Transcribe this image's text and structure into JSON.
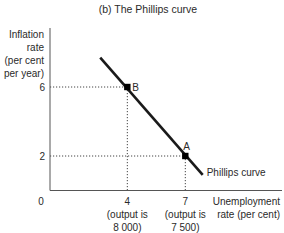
{
  "chart_data": {
    "type": "line",
    "title": "(b) The Phillips curve",
    "ylabel_lines": [
      "Inflation",
      "rate",
      "(per cent",
      "per year)"
    ],
    "xlabel_lines": [
      "Unemployment",
      "rate (per cent)"
    ],
    "origin_label": "0",
    "xlim": [
      0,
      9
    ],
    "ylim": [
      0,
      8
    ],
    "grid": false,
    "x_ticks": [
      {
        "value": 4,
        "label": "4",
        "sublabel_lines": [
          "(output is",
          "8 000)"
        ]
      },
      {
        "value": 7,
        "label": "7",
        "sublabel_lines": [
          "(output is",
          "7 500)"
        ]
      }
    ],
    "y_ticks": [
      {
        "value": 6,
        "label": "6"
      },
      {
        "value": 2,
        "label": "2"
      }
    ],
    "series": [
      {
        "name": "Phillips curve",
        "label": "Phillips curve",
        "color": "#1a1a1a",
        "x": [
          2.6,
          7.9
        ],
        "y": [
          7.7,
          0.9
        ]
      }
    ],
    "points": [
      {
        "name": "B",
        "x": 4,
        "y": 6
      },
      {
        "name": "A",
        "x": 7,
        "y": 2
      }
    ],
    "guide_lines": "dotted"
  }
}
